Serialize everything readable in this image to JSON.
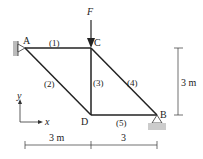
{
  "diagram": {
    "type": "truss",
    "load": {
      "label": "F",
      "node": "C",
      "direction": "down"
    },
    "nodes": [
      {
        "id": "A",
        "label": "A",
        "support": "pin-wall"
      },
      {
        "id": "C",
        "label": "C"
      },
      {
        "id": "D",
        "label": "D"
      },
      {
        "id": "B",
        "label": "B",
        "support": "pin-ground"
      }
    ],
    "members": [
      {
        "label": "(1)",
        "from": "A",
        "to": "C"
      },
      {
        "label": "(2)",
        "from": "A",
        "to": "D"
      },
      {
        "label": "(3)",
        "from": "C",
        "to": "D"
      },
      {
        "label": "(4)",
        "from": "C",
        "to": "B"
      },
      {
        "label": "(5)",
        "from": "D",
        "to": "B"
      }
    ],
    "dimensions": {
      "height": "3 m",
      "left_span": "3 m",
      "right_span": "3"
    },
    "axes": {
      "x": "x",
      "y": "y"
    }
  }
}
